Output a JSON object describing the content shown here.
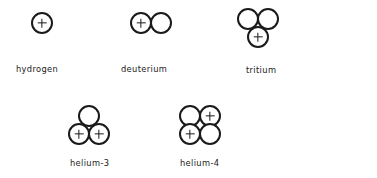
{
  "diagram": {
    "background_color": "#ffffff",
    "stroke_color": "#1a1a1a",
    "isotopes": [
      {
        "id": "hydrogen",
        "label": "hydrogen",
        "proton_count": 1,
        "neutron_count": 0,
        "nucleons": [
          {
            "type": "proton",
            "symbol": "+"
          }
        ]
      },
      {
        "id": "deuterium",
        "label": "deuterium",
        "proton_count": 1,
        "neutron_count": 1,
        "nucleons": [
          {
            "type": "proton",
            "symbol": "+"
          },
          {
            "type": "neutron",
            "symbol": ""
          }
        ]
      },
      {
        "id": "tritium",
        "label": "tritium",
        "proton_count": 1,
        "neutron_count": 2,
        "nucleons": [
          {
            "type": "neutron",
            "symbol": ""
          },
          {
            "type": "neutron",
            "symbol": ""
          },
          {
            "type": "proton",
            "symbol": "+"
          }
        ]
      },
      {
        "id": "helium-3",
        "label": "helium-3",
        "proton_count": 2,
        "neutron_count": 1,
        "nucleons": [
          {
            "type": "neutron",
            "symbol": ""
          },
          {
            "type": "proton",
            "symbol": "+"
          },
          {
            "type": "proton",
            "symbol": "+"
          }
        ]
      },
      {
        "id": "helium-4",
        "label": "helium-4",
        "proton_count": 2,
        "neutron_count": 2,
        "nucleons": [
          {
            "type": "neutron",
            "symbol": ""
          },
          {
            "type": "proton",
            "symbol": "+"
          },
          {
            "type": "proton",
            "symbol": "+"
          },
          {
            "type": "neutron",
            "symbol": ""
          }
        ]
      }
    ]
  }
}
